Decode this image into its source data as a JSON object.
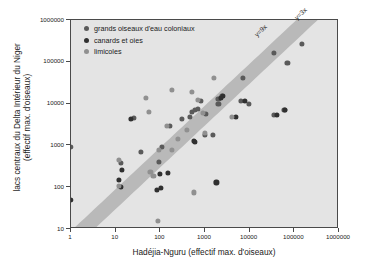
{
  "chart_data": {
    "type": "scatter",
    "title": "",
    "xlabel": "Hadéjia-Nguru (effectif max. d'oiseaux)",
    "ylabel": "lacs centraux du Delta Intérieur du Niger (effectif max. d'oiseaux)",
    "ylabel_line1": "lacs centraux du Delta Intérieur du Niger",
    "ylabel_line2": "(effectif max. d'oiseaux)",
    "xscale": "log",
    "yscale": "log",
    "xlim": [
      1,
      1000000
    ],
    "ylim": [
      10,
      1000000
    ],
    "grid": false,
    "legend_position": "top-left",
    "xticks": [
      "1",
      "10",
      "100",
      "1000",
      "10000",
      "100000",
      "1000000"
    ],
    "xtick_values": [
      1,
      10,
      100,
      1000,
      10000,
      100000,
      1000000
    ],
    "yticks": [
      "10",
      "100",
      "1000",
      "10000",
      "100000",
      "1000000"
    ],
    "ytick_values": [
      10,
      100,
      1000,
      10000,
      100000,
      1000000
    ],
    "annotations": [
      {
        "text": "y=9x",
        "slope_ratio": 9
      },
      {
        "text": "y=3x",
        "slope_ratio": 3
      }
    ],
    "band": {
      "lower": "y=3x",
      "upper": "y=9x",
      "color": "#b9b9b9"
    },
    "colors": {
      "colonial_waterbirds": "#5a5a5a",
      "ducks_geese": "#303030",
      "waders": "#909090",
      "plot_background": "#e4e4e4",
      "frame": "#4a4a4a"
    },
    "series": [
      {
        "name": "grands oiseaux d'eau coloniaux",
        "color": "#5a5a5a",
        "points": [
          [
            1,
            900
          ],
          [
            26,
            4500
          ],
          [
            36,
            700
          ],
          [
            13,
            390
          ],
          [
            95,
            400
          ],
          [
            110,
            900
          ],
          [
            160,
            2900
          ],
          [
            300,
            4400
          ],
          [
            460,
            4900
          ],
          [
            520,
            6400
          ],
          [
            600,
            6900
          ],
          [
            700,
            7400
          ],
          [
            800,
            11500
          ],
          [
            1050,
            5800
          ],
          [
            980,
            1800
          ],
          [
            1500,
            1800
          ],
          [
            2000,
            13000
          ],
          [
            2400,
            15500
          ],
          [
            2000,
            9600
          ],
          [
            7000,
            42000
          ],
          [
            6500,
            11800
          ],
          [
            9500,
            10000
          ],
          [
            35000,
            160000
          ],
          [
            150000,
            270000
          ],
          [
            35000,
            5500
          ],
          [
            60000,
            7100
          ],
          [
            70000,
            95000
          ]
        ]
      },
      {
        "name": "canards et oies",
        "color": "#303030",
        "points": [
          [
            1,
            50
          ],
          [
            14,
            260
          ],
          [
            12,
            150
          ],
          [
            13,
            100
          ],
          [
            22,
            4400
          ],
          [
            85,
            85
          ],
          [
            105,
            95
          ],
          [
            100,
            210
          ],
          [
            150,
            215
          ],
          [
            560,
            1300
          ],
          [
            600,
            1200
          ],
          [
            1800,
            130
          ],
          [
            2300,
            14000
          ],
          [
            2500,
            15600
          ],
          [
            5000,
            4900
          ],
          [
            8000,
            11500
          ],
          [
            40000,
            5400
          ],
          [
            62000,
            7000
          ]
        ]
      },
      {
        "name": "limicoles",
        "color": "#909090",
        "points": [
          [
            12,
            440
          ],
          [
            12,
            110
          ],
          [
            47,
            13500
          ],
          [
            55,
            6200
          ],
          [
            60,
            230
          ],
          [
            70,
            190
          ],
          [
            90,
            16
          ],
          [
            95,
            780
          ],
          [
            180,
            21000
          ],
          [
            180,
            780
          ],
          [
            390,
            2400
          ],
          [
            500,
            19500
          ],
          [
            560,
            75
          ],
          [
            900,
            5900
          ],
          [
            1000,
            2000
          ],
          [
            1600,
            41000
          ],
          [
            4000,
            4700
          ],
          [
            250,
            1450
          ],
          [
            700,
            12000
          ],
          [
            140,
            2950
          ]
        ]
      }
    ]
  },
  "legend": {
    "items": [
      {
        "label": "grands oiseaux d'eau coloniaux",
        "color": "#5a5a5a"
      },
      {
        "label": "canards et oies",
        "color": "#303030"
      },
      {
        "label": "limicoles",
        "color": "#909090"
      }
    ]
  }
}
